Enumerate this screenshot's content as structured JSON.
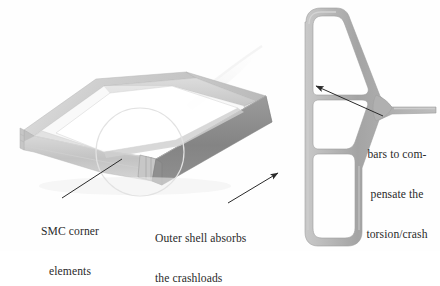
{
  "figure": {
    "type": "technical-illustration",
    "background_color": "#fefefe",
    "ink_color": "#2a2a2a"
  },
  "annotations": [
    {
      "id": "smc-corner",
      "lines": [
        "SMC corner",
        "elements"
      ],
      "align": "center",
      "x": 24,
      "y": 199,
      "leader": {
        "type": "line",
        "from": [
          122,
          159
        ],
        "to": [
          62,
          198
        ]
      }
    },
    {
      "id": "outer-shell",
      "lines": [
        "Outer shell absorbs",
        "the crashloads"
      ],
      "align": "left",
      "x": 155,
      "y": 206,
      "leader": {
        "type": "arrow",
        "from": [
          228,
          203
        ],
        "to": [
          278,
          173
        ]
      }
    },
    {
      "id": "bars-torsion",
      "lines": [
        "bars to com-",
        "pensate the",
        "torsion/crash"
      ],
      "align": "center",
      "x": 357,
      "y": 122,
      "leader": {
        "type": "arrow",
        "from": [
          383,
          116
        ],
        "to": [
          316,
          86
        ]
      }
    }
  ],
  "objects": {
    "frame_3d": {
      "name": "rectangular-frame-perspective",
      "colors": {
        "top_face": "#d2d2d2",
        "front_face": "#b4b4b4",
        "right_face": "#8a8a8a",
        "inner_face": "#c8c8c8",
        "edge": "#9a9a9a",
        "highlight": "#efefef"
      },
      "highlight_circle": {
        "cx": 140,
        "cy": 152,
        "r": 44,
        "stroke": "#e0e0e0"
      }
    },
    "cross_section": {
      "name": "multi-cell-extrusion-profile",
      "cells": 3,
      "has_flange": true,
      "colors": {
        "wall": "#a9a9a9",
        "wall_light": "#c5c5c5",
        "void": "#ffffff"
      }
    }
  }
}
